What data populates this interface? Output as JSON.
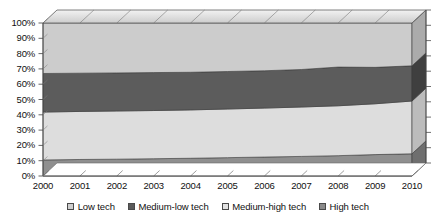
{
  "chart_data": {
    "type": "area",
    "title": "",
    "subtitle": "",
    "xlabel": "",
    "ylabel": "",
    "stacked": true,
    "normalized": true,
    "grid": false,
    "legend_position": "bottom",
    "ylim": [
      0,
      100
    ],
    "ytick_labels": [
      "100%",
      "90%",
      "80%",
      "70%",
      "60%",
      "50%",
      "40%",
      "30%",
      "20%",
      "10%",
      "0%"
    ],
    "ytick_values": [
      100,
      90,
      80,
      70,
      60,
      50,
      40,
      30,
      20,
      10,
      0
    ],
    "categories": [
      "2000",
      "2001",
      "2002",
      "2003",
      "2004",
      "2005",
      "2006",
      "2007",
      "2008",
      "2009",
      "2010"
    ],
    "x": [
      2000,
      2001,
      2002,
      2003,
      2004,
      2005,
      2006,
      2007,
      2008,
      2009,
      2010
    ],
    "series": [
      {
        "name": "High tech",
        "color": "#8a8a8a",
        "values": [
          10.5,
          10.8,
          11.0,
          11.3,
          11.6,
          12.0,
          12.4,
          12.8,
          13.3,
          14.0,
          14.5
        ]
      },
      {
        "name": "Medium-high tech",
        "color": "#d9d9d9",
        "values": [
          31.3,
          31.4,
          31.5,
          31.5,
          31.6,
          31.8,
          32.0,
          32.3,
          32.6,
          33.2,
          34.5
        ]
      },
      {
        "name": "Medium-low tech",
        "color": "#5a5a5a",
        "values": [
          25.2,
          25.0,
          24.9,
          24.8,
          24.6,
          24.5,
          24.4,
          24.5,
          25.3,
          23.8,
          23.0
        ]
      },
      {
        "name": "Low tech",
        "color": "#cfcfcf",
        "values": [
          33.0,
          32.8,
          32.6,
          32.4,
          32.2,
          31.7,
          31.2,
          30.4,
          28.8,
          29.0,
          28.0
        ]
      }
    ],
    "cumulative_boundaries": {
      "high_tech_top": [
        10.5,
        10.8,
        11.0,
        11.3,
        11.6,
        12.0,
        12.4,
        12.8,
        13.3,
        14.0,
        14.5
      ],
      "medium_high_tech_top": [
        41.8,
        42.2,
        42.5,
        42.8,
        43.2,
        43.8,
        44.4,
        45.1,
        45.9,
        47.2,
        49.0
      ],
      "medium_low_tech_top": [
        67.0,
        67.2,
        67.4,
        67.6,
        67.8,
        68.3,
        68.8,
        69.6,
        71.2,
        71.0,
        72.0
      ],
      "low_tech_top": [
        100,
        100,
        100,
        100,
        100,
        100,
        100,
        100,
        100,
        100,
        100
      ]
    }
  },
  "legend": {
    "items": [
      {
        "label": "Low tech",
        "color": "#cfcfcf"
      },
      {
        "label": "Medium-low tech",
        "color": "#5a5a5a"
      },
      {
        "label": "Medium-high tech",
        "color": "#e2e2e2"
      },
      {
        "label": "High tech",
        "color": "#8a8a8a"
      }
    ]
  }
}
